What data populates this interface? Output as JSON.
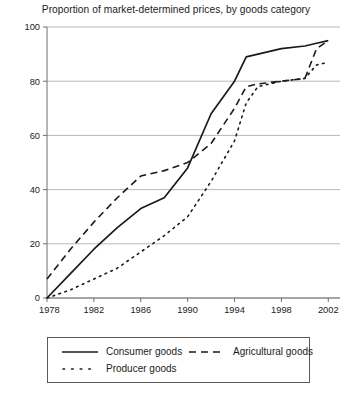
{
  "chart_data": {
    "type": "line",
    "title": "Proportion of market-determined prices, by goods category",
    "xlabel": "",
    "ylabel": "",
    "xlim": [
      1978,
      2003
    ],
    "ylim": [
      0,
      100
    ],
    "grid": true,
    "legend_position": "bottom",
    "xticks": [
      1978,
      1982,
      1986,
      1990,
      1994,
      1998,
      2002
    ],
    "xtick_labels": [
      "1978",
      "1982",
      "1986",
      "1990",
      "1994",
      "1998",
      "2002"
    ],
    "yticks": [
      0,
      20,
      40,
      60,
      80,
      100
    ],
    "ytick_labels": [
      "0",
      "20",
      "40",
      "60",
      "80",
      "100"
    ],
    "x": [
      1978,
      1980,
      1982,
      1984,
      1986,
      1988,
      1990,
      1992,
      1994,
      1995,
      1996,
      1998,
      2000,
      2001,
      2002
    ],
    "series": [
      {
        "name": "Consumer goods",
        "style": "solid",
        "color": "#1a1a1a",
        "values": [
          0,
          9,
          18,
          26,
          33,
          37,
          48,
          68,
          80,
          89,
          90,
          92,
          93,
          94,
          95
        ]
      },
      {
        "name": "Agricultural goods",
        "style": "dashed",
        "color": "#1a1a1a",
        "values": [
          7,
          18,
          28,
          37,
          45,
          47,
          50,
          57,
          70,
          78,
          79,
          80,
          81,
          92,
          95
        ]
      },
      {
        "name": "Producer goods",
        "style": "dotted",
        "color": "#1a1a1a",
        "values": [
          0,
          3,
          7,
          11,
          17,
          23,
          30,
          43,
          58,
          72,
          78,
          80,
          81,
          86,
          87
        ]
      }
    ]
  },
  "legend": {
    "entries": [
      {
        "label": "Consumer goods",
        "style": "solid"
      },
      {
        "label": "Agricultural goods",
        "style": "dashed"
      },
      {
        "label": "Producer goods",
        "style": "dotted"
      }
    ]
  },
  "colors": {
    "ink": "#1a1a1a",
    "gridline": "#b9b9b9",
    "axis": "#6e6e6e",
    "background": "#ffffff"
  }
}
